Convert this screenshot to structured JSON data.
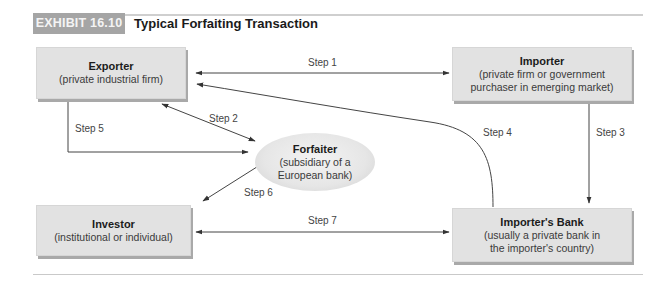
{
  "header": {
    "exhibit_label": "EXHIBIT 16.10",
    "title": "Typical Forfaiting Transaction"
  },
  "nodes": {
    "exporter": {
      "name": "Exporter",
      "desc": [
        "(private industrial firm)"
      ]
    },
    "importer": {
      "name": "Importer",
      "desc": [
        "(private firm or government",
        "purchaser in emerging market)"
      ]
    },
    "forfaiter": {
      "name": "Forfaiter",
      "desc": [
        "(subsidiary of a",
        "European bank)"
      ]
    },
    "investor": {
      "name": "Investor",
      "desc": [
        "(institutional or individual)"
      ]
    },
    "importers_bank": {
      "name": "Importer's Bank",
      "desc": [
        "(usually a private bank in",
        "the importer's country)"
      ]
    }
  },
  "steps": [
    {
      "label": "Step 1",
      "from": "Exporter",
      "to": "Importer",
      "direction": "bidirectional"
    },
    {
      "label": "Step 2",
      "from": "Exporter",
      "to": "Forfaiter",
      "direction": "bidirectional"
    },
    {
      "label": "Step 3",
      "from": "Importer",
      "to": "Importer's Bank",
      "direction": "one-way"
    },
    {
      "label": "Step 4",
      "from": "Importer's Bank",
      "to": "Exporter",
      "direction": "one-way"
    },
    {
      "label": "Step 5",
      "from": "Exporter",
      "to": "Forfaiter",
      "direction": "one-way"
    },
    {
      "label": "Step 6",
      "from": "Forfaiter",
      "to": "Investor",
      "direction": "one-way"
    },
    {
      "label": "Step 7",
      "from": "Investor",
      "to": "Importer's Bank",
      "direction": "bidirectional"
    }
  ],
  "colors": {
    "exhibit_tag_bg": "#a5a5a5",
    "box_fill": "#e2e2e2",
    "box_shadow": "#a9a9a9",
    "arrow": "#333333"
  }
}
